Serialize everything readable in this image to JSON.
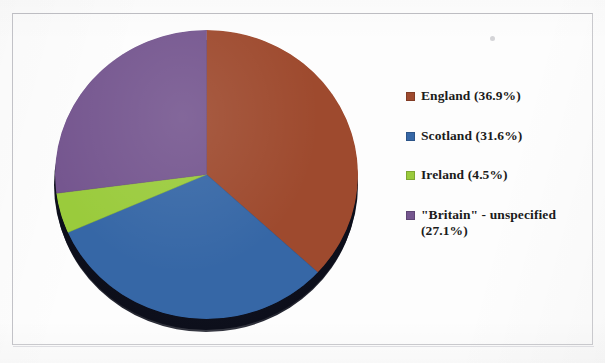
{
  "figure": {
    "background_color": "#fdfdfd",
    "frame_color": "#c9c9cd"
  },
  "chart_data": {
    "type": "pie",
    "title": "",
    "subtitle": "",
    "xlabel": "",
    "ylabel": "",
    "start_angle_deg": 0,
    "direction": "clockwise",
    "three_d": true,
    "legend_position": "right",
    "grid": false,
    "categories": [
      "England",
      "Scotland",
      "Ireland",
      "\"Britain\" - unspecified"
    ],
    "values": [
      36.9,
      31.6,
      4.5,
      27.1
    ],
    "units": "percent",
    "colors": [
      "#9e4a2e",
      "#3667a6",
      "#9acb3c",
      "#75568f"
    ],
    "slices": [
      {
        "label": "England",
        "value": 36.9,
        "color": "#9e4a2e",
        "start_deg": 0.0,
        "end_deg": 132.84
      },
      {
        "label": "Scotland",
        "value": 31.6,
        "color": "#3667a6",
        "start_deg": 132.84,
        "end_deg": 246.6
      },
      {
        "label": "Ireland",
        "value": 4.5,
        "color": "#9acb3c",
        "start_deg": 246.6,
        "end_deg": 262.8
      },
      {
        "label": "\"Britain\" - unspecified",
        "value": 27.1,
        "color": "#75568f",
        "start_deg": 262.8,
        "end_deg": 360.0
      }
    ]
  },
  "legend": {
    "items": [
      {
        "label": "England (36.9%)",
        "color": "#9e4a2e",
        "swatch": "legend-swatch-england"
      },
      {
        "label": "Scotland (31.6%)",
        "color": "#3667a6",
        "swatch": "legend-swatch-scotland"
      },
      {
        "label": "Ireland (4.5%)",
        "color": "#9acb3c",
        "swatch": "legend-swatch-ireland"
      },
      {
        "label": "\"Britain\" - unspecified\n(27.1%)",
        "color": "#75568f",
        "swatch": "legend-swatch-britain"
      }
    ]
  }
}
